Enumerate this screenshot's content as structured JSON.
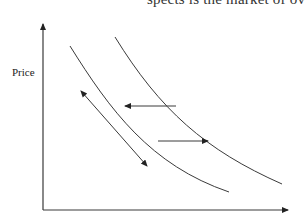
{
  "caption_fragment": "spects is the market of over",
  "diagram": {
    "type": "supply-demand-shift",
    "y_axis_label": "Price",
    "x_axis_label": "",
    "curves": [
      {
        "name": "demand-curve-1",
        "position": "left/lower"
      },
      {
        "name": "demand-curve-2",
        "position": "right/upper"
      }
    ],
    "arrows": [
      {
        "name": "shift-left-arrow",
        "direction": "left",
        "between": "curve-2 to curve-1"
      },
      {
        "name": "shift-right-arrow",
        "direction": "right",
        "between": "curve-1 to curve-2"
      },
      {
        "name": "movement-along-curve-arrow",
        "direction": "both",
        "parallel_to": "curve-1"
      }
    ]
  },
  "colors": {
    "line": "#3a3a3a",
    "background": "#ffffff"
  }
}
